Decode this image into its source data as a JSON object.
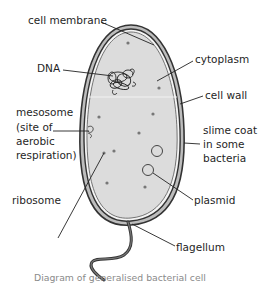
{
  "diagram": {
    "title": "Diagram of generalised bacterial cell",
    "labels": {
      "cell_membrane": "cell membrane",
      "dna": "DNA",
      "cytoplasm": "cytoplasm",
      "cell_wall": "cell wall",
      "mesosome_1": "mesosome",
      "mesosome_2": "(site of",
      "mesosome_3": "aerobic",
      "mesosome_4": "respiration)",
      "slime_coat_1": "slime coat",
      "slime_coat_2": "in some",
      "slime_coat_3": "bacteria",
      "ribosome": "ribosome",
      "plasmid": "plasmid",
      "flagellum": "flagellum"
    },
    "colors": {
      "cytoplasm_fill": "#dcdcdc",
      "outline": "#333333",
      "caption": "#8a8a8a"
    }
  }
}
